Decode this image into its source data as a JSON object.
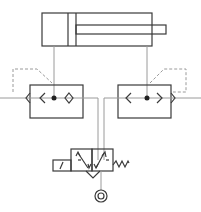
{
  "diagram": {
    "type": "pneumatic-circuit",
    "components": [
      {
        "id": "cylinder",
        "kind": "double-acting-cylinder"
      },
      {
        "id": "left-valve",
        "kind": "quick-exhaust-valve"
      },
      {
        "id": "right-valve",
        "kind": "quick-exhaust-valve"
      },
      {
        "id": "main-valve",
        "kind": "5-2-solenoid-valve-spring-return"
      },
      {
        "id": "supply",
        "kind": "pressure-source"
      }
    ],
    "colors": {
      "lines": "#3a3a3a",
      "pipes": "#9a9a9a",
      "pilot": "#9a9a9a"
    }
  }
}
